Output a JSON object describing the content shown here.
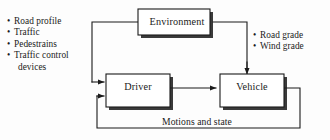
{
  "diagram": {
    "colors": {
      "line": "#1a1a1a",
      "shadow": "#3a3a3a",
      "box_fill": "#ffffff",
      "background": "#fdfdfd",
      "text": "#1a1a1a"
    },
    "blocks": [
      {
        "id": "environment",
        "label": "Environment"
      },
      {
        "id": "driver",
        "label": "Driver"
      },
      {
        "id": "vehicle",
        "label": "Vehicle"
      }
    ],
    "left_inputs": {
      "items": [
        {
          "bullet": "•",
          "text": "Road profile"
        },
        {
          "bullet": "•",
          "text": "Traffic"
        },
        {
          "bullet": "•",
          "text": "Pedestrains"
        },
        {
          "bullet": "•",
          "text": "Traffic control",
          "continuation": "devices"
        }
      ]
    },
    "right_outputs": {
      "items": [
        {
          "bullet": "•",
          "text": "Road grade"
        },
        {
          "bullet": "•",
          "text": "Wind grade"
        }
      ]
    },
    "feedback": {
      "label": "Motions and state"
    }
  }
}
